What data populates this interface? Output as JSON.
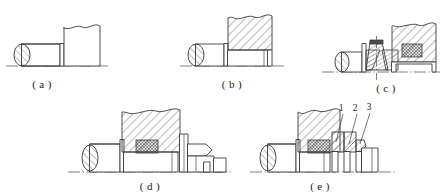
{
  "figure": {
    "background_color": "#ffffff",
    "line_color": "#3a3a3a",
    "hatch_color": "#4a4a4a"
  },
  "panels": [
    {
      "id": "a",
      "caption": "( a )",
      "description": "Plain shaft end with simple housing step, no seal element"
    },
    {
      "id": "b",
      "caption": "( b )",
      "description": "Shaft with sectioned hatched housing block"
    },
    {
      "id": "c",
      "caption": "( c )",
      "description": "Shaft with conical wedge packing element and mesh seal block"
    },
    {
      "id": "d",
      "caption": "( d )",
      "description": "Shaft with hatched housing, mesh seal and stepped gland profile"
    },
    {
      "id": "e",
      "caption": "( e )",
      "description": "Shaft with hatched housing, mesh seal and three numbered seal components"
    }
  ],
  "callouts": [
    {
      "label": "1",
      "x": 344,
      "y": 110
    },
    {
      "label": "2",
      "x": 358,
      "y": 110
    },
    {
      "label": "3",
      "x": 371,
      "y": 109
    }
  ]
}
